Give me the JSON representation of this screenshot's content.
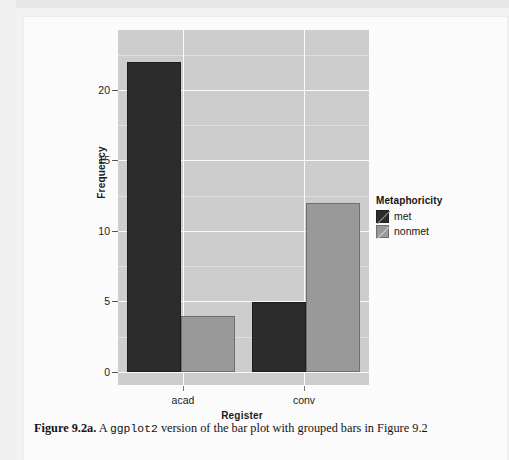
{
  "chart_data": {
    "type": "bar",
    "title": "",
    "subtitle": "",
    "xlabel": "Register",
    "ylabel": "Frequency",
    "categories": [
      "acad",
      "conv"
    ],
    "series": [
      {
        "name": "met",
        "values": [
          22,
          5
        ],
        "color": "#2c2c2c"
      },
      {
        "name": "nonmet",
        "values": [
          4,
          12
        ],
        "color": "#999999"
      }
    ],
    "legend": {
      "title": "Metaphoricity",
      "position": "right",
      "entries": [
        "met",
        "nonmet"
      ]
    },
    "yticks": [
      0,
      5,
      10,
      15,
      20
    ],
    "ytick_labels": [
      "0",
      "5",
      "10",
      "15",
      "20"
    ],
    "ylim": [
      -0.4,
      23.2
    ],
    "grid": true,
    "grid_minor": true,
    "panel_background": "#cdcdcd",
    "gridline_color": "#fafafa",
    "bar_group_mode": "dodged"
  },
  "axes": {
    "y_title": "Frequency",
    "x_title": "Register",
    "y_tick_labels": [
      "20",
      "15",
      "10",
      "5",
      "0"
    ],
    "x_tick_labels": [
      "acad",
      "conv"
    ]
  },
  "legend": {
    "title": "Metaphoricity",
    "items": [
      {
        "label": "met",
        "color": "#2c2c2c"
      },
      {
        "label": "nonmet",
        "color": "#999999"
      }
    ]
  },
  "caption": {
    "label": "Figure 9.2a.",
    "text_before": " A ",
    "mono": "ggplot2",
    "text_after": " version of the bar plot with grouped bars in Figure 9.2"
  }
}
